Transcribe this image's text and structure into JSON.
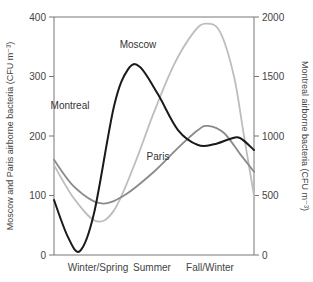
{
  "chart_data": {
    "type": "line",
    "title": "",
    "xlabel": "",
    "x_tick_labels": [
      {
        "label": "Winter/Spring",
        "x": 0.22
      },
      {
        "label": "Summer",
        "x": 0.49
      },
      {
        "label": "Fall/Winter",
        "x": 0.78
      }
    ],
    "x_range": [
      0,
      1
    ],
    "y_left": {
      "label": "Moscow and Paris airborne bacteria (CFU m⁻³)",
      "range": [
        0,
        400
      ],
      "ticks": [
        0,
        100,
        200,
        300,
        400
      ]
    },
    "y_right": {
      "label": "Montreal airborne bacteria (CFU m⁻³)",
      "range": [
        0,
        2000
      ],
      "ticks": [
        0,
        500,
        1000,
        1500,
        2000
      ]
    },
    "grid": false,
    "series": [
      {
        "name": "Moscow",
        "axis": "left",
        "color": "#bdbdbd",
        "label_at": {
          "x": 0.42,
          "y": 348
        },
        "x": [
          0,
          0.1,
          0.21,
          0.3,
          0.4,
          0.5,
          0.6,
          0.7,
          0.76,
          0.83,
          0.9,
          0.95,
          1.0
        ],
        "values": [
          151,
          95,
          57,
          75,
          150,
          240,
          320,
          375,
          389,
          375,
          300,
          200,
          100
        ]
      },
      {
        "name": "Paris",
        "axis": "left",
        "color": "#8a8a8a",
        "label_at": {
          "x": 0.52,
          "y": 160
        },
        "x": [
          0,
          0.1,
          0.23,
          0.35,
          0.5,
          0.62,
          0.72,
          0.77,
          0.85,
          0.93,
          1.0
        ],
        "values": [
          160,
          115,
          87,
          100,
          140,
          180,
          210,
          217,
          205,
          170,
          140
        ]
      },
      {
        "name": "Montreal",
        "axis": "right",
        "color": "#1a1a1a",
        "label_at": {
          "x": 0.08,
          "y": 1230
        },
        "x": [
          0,
          0.07,
          0.13,
          0.2,
          0.3,
          0.37,
          0.43,
          0.52,
          0.62,
          0.72,
          0.8,
          0.88,
          0.93,
          1.0
        ],
        "values": [
          462,
          150,
          34,
          350,
          1250,
          1560,
          1580,
          1350,
          1050,
          924,
          930,
          975,
          983,
          882
        ]
      }
    ]
  }
}
